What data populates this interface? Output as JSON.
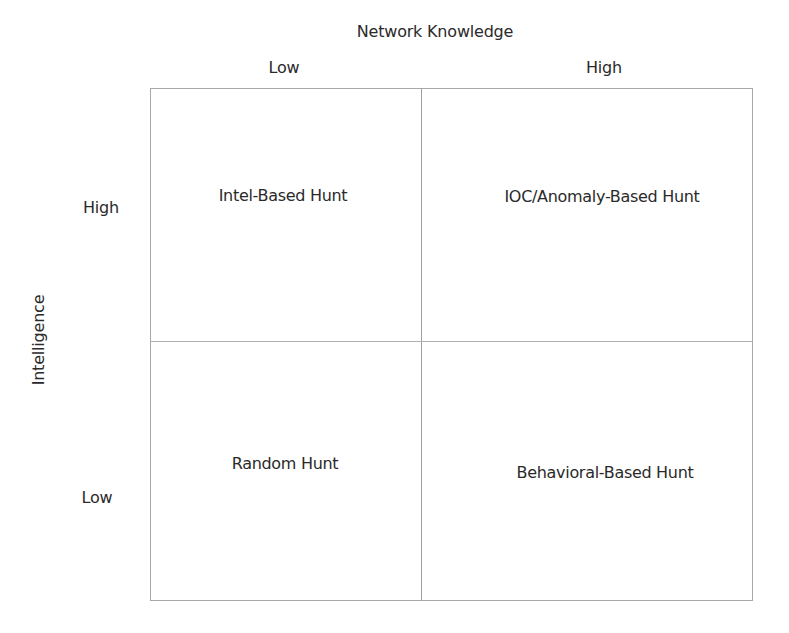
{
  "diagram": {
    "type": "2x2-matrix",
    "x_axis": {
      "title": "Network Knowledge",
      "columns": [
        {
          "label": "Low"
        },
        {
          "label": "High"
        }
      ]
    },
    "y_axis": {
      "title": "Intelligence",
      "rows": [
        {
          "label": "High"
        },
        {
          "label": "Low"
        }
      ]
    },
    "cells": [
      {
        "row": "High",
        "column": "Low",
        "label": "Intel-Based Hunt"
      },
      {
        "row": "High",
        "column": "High",
        "label": "IOC/Anomaly-Based Hunt"
      },
      {
        "row": "Low",
        "column": "Low",
        "label": "Random Hunt"
      },
      {
        "row": "Low",
        "column": "High",
        "label": "Behavioral-Based Hunt"
      }
    ],
    "colors": {
      "text": "#2a2a2a",
      "grid_lines": "#a8a8a8",
      "background": "#ffffff"
    }
  }
}
